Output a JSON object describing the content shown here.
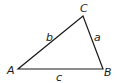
{
  "diagram": {
    "type": "triangle",
    "vertices": [
      {
        "name": "A",
        "label": "A",
        "x": 18,
        "y": 69
      },
      {
        "name": "B",
        "label": "B",
        "x": 103,
        "y": 69
      },
      {
        "name": "C",
        "label": "C",
        "x": 83,
        "y": 16
      }
    ],
    "sides": [
      {
        "name": "a",
        "label": "a",
        "from": "B",
        "to": "C"
      },
      {
        "name": "b",
        "label": "b",
        "from": "A",
        "to": "C"
      },
      {
        "name": "c",
        "label": "c",
        "from": "A",
        "to": "B"
      }
    ],
    "stroke_color": "#1a1a1a"
  }
}
